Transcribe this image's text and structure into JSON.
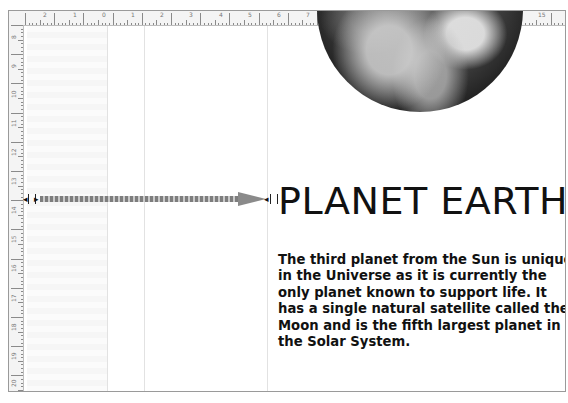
{
  "window": {
    "type": "slide-editor-canvas"
  },
  "rulers": {
    "horizontal": {
      "labels": [
        "2",
        "1",
        "0",
        "1",
        "2",
        "3",
        "4",
        "5",
        "6",
        "7",
        "8",
        "9",
        "10",
        "11",
        "12",
        "13",
        "14",
        "15"
      ]
    },
    "vertical": {
      "labels": [
        "8",
        "9",
        "10",
        "11",
        "12",
        "13",
        "14",
        "15",
        "16",
        "17",
        "18",
        "19",
        "20"
      ]
    }
  },
  "slide": {
    "title": "PLANET EARTH",
    "body": "The third planet from the Sun is unique in the Universe as it is currently the only planet known to support life. It has a single natural satellite called the Moon and is the fifth largest planet in the Solar System.",
    "image": {
      "subject": "earth-globe"
    },
    "motion_path": {
      "type": "arrow",
      "direction": "right"
    }
  },
  "colors": {
    "text": "#111111",
    "ruler_bg": "#f4f4f4",
    "border": "#9a9a9a",
    "arrow": "#8a8a8a"
  }
}
